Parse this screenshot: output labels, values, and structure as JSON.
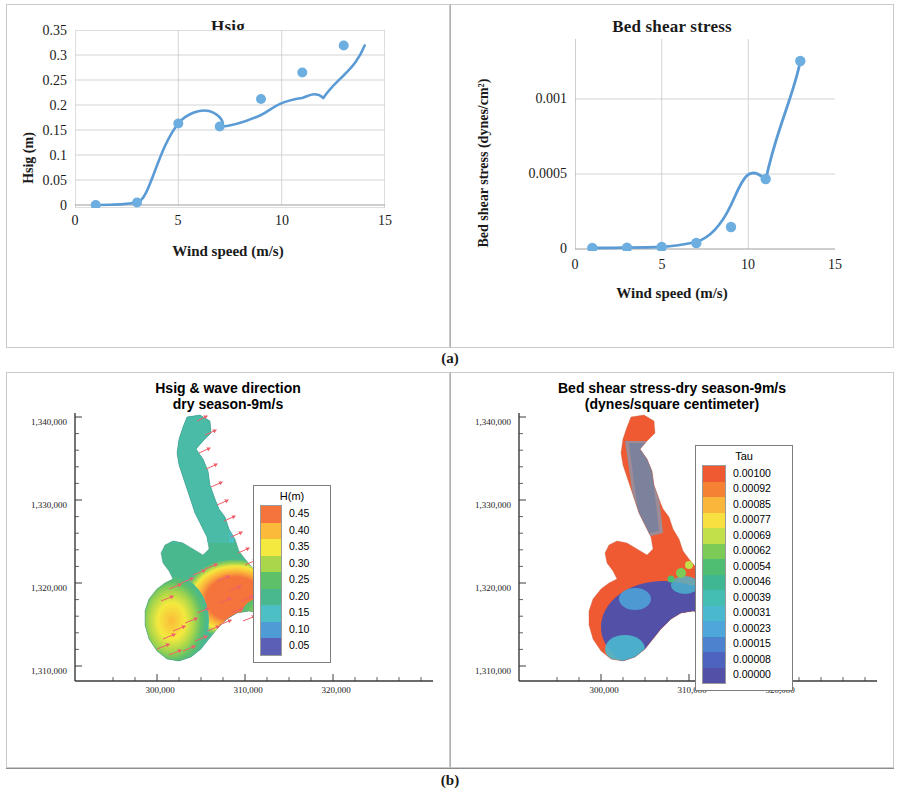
{
  "figure": {
    "caption_a": "(a)",
    "caption_b": "(b)"
  },
  "panel_a": {
    "left": {
      "title": "Hsig",
      "ylabel": "Hsig (m)",
      "xlabel": "Wind speed (m/s)",
      "yticks": [
        "0",
        "0.05",
        "0.1",
        "0.15",
        "0.2",
        "0.25",
        "0.3",
        "0.35"
      ],
      "xticks": [
        "0",
        "5",
        "10",
        "15"
      ]
    },
    "right": {
      "title": "Bed shear stress",
      "ylabel": "Bed shear stress (dynes/cm²)",
      "xlabel": "Wind speed (m/s)",
      "yticks": [
        "0",
        "0.0005",
        "0.001"
      ],
      "xticks": [
        "0",
        "5",
        "10",
        "15"
      ]
    }
  },
  "panel_b": {
    "left": {
      "title_line1": "Hsig & wave direction",
      "title_line2": "dry season-9m/s",
      "yticks": [
        "1,340,000",
        "1,330,000",
        "1,320,000",
        "1,310,000"
      ],
      "xticks": [
        "300,000",
        "310,000",
        "320,000"
      ],
      "legend": {
        "title": "H(m)",
        "labels": [
          "0.45",
          "0.40",
          "0.35",
          "0.30",
          "0.25",
          "0.20",
          "0.15",
          "0.10",
          "0.05"
        ],
        "colors": [
          "#F4743B",
          "#FBBA3A",
          "#F4E93E",
          "#A9D64A",
          "#5FC06A",
          "#49B88E",
          "#4BBFC4",
          "#4E9BD6",
          "#5B5FB5"
        ]
      }
    },
    "right": {
      "title_line1": "Bed shear stress-dry season-9m/s",
      "title_line2": "(dynes/square centimeter)",
      "yticks": [
        "1,340,000",
        "1,330,000",
        "1,320,000",
        "1,310,000"
      ],
      "xticks": [
        "300,000",
        "310,000",
        "320,000"
      ],
      "legend": {
        "title": "Tau",
        "labels": [
          "0.00100",
          "0.00092",
          "0.00085",
          "0.00077",
          "0.00069",
          "0.00062",
          "0.00054",
          "0.00046",
          "0.00039",
          "0.00031",
          "0.00023",
          "0.00015",
          "0.00008",
          "0.00000"
        ],
        "colors": [
          "#F05A32",
          "#F58233",
          "#F9B63A",
          "#F7E03F",
          "#C2E04A",
          "#7DCB57",
          "#4FBE73",
          "#3FB792",
          "#44BDB2",
          "#4AB9CF",
          "#4FA6DA",
          "#4C82CE",
          "#4E63BE",
          "#5350A8"
        ]
      }
    }
  },
  "chart_data": [
    {
      "type": "line",
      "title": "Hsig",
      "xlabel": "Wind speed (m/s)",
      "ylabel": "Hsig (m)",
      "x": [
        1,
        3,
        5,
        7,
        9,
        11,
        13
      ],
      "values": [
        0.0,
        0.005,
        0.163,
        0.159,
        0.212,
        0.265,
        0.32
      ],
      "xlim": [
        0,
        15
      ],
      "ylim": [
        0,
        0.35
      ],
      "xticks": [
        0,
        5,
        10,
        15
      ],
      "yticks": [
        0,
        0.05,
        0.1,
        0.15,
        0.2,
        0.25,
        0.3,
        0.35
      ],
      "grid": true,
      "legend": "none",
      "series_color": "#5B9BD5",
      "marker": "circle",
      "smooth": true
    },
    {
      "type": "line",
      "title": "Bed shear stress",
      "xlabel": "Wind speed (m/s)",
      "ylabel": "Bed shear stress (dynes/cm²)",
      "x": [
        1,
        3,
        5,
        7,
        9,
        11,
        13
      ],
      "values": [
        2e-06,
        3e-06,
        5e-06,
        2e-05,
        0.00015,
        0.00047,
        0.00126
      ],
      "xlim": [
        0,
        15
      ],
      "ylim": [
        0,
        0.0014
      ],
      "xticks": [
        0,
        5,
        10,
        15
      ],
      "yticks": [
        0,
        0.0005,
        0.001
      ],
      "grid": true,
      "legend": "none",
      "series_color": "#5B9BD5",
      "marker": "circle",
      "smooth": true
    },
    {
      "type": "heatmap",
      "title": "Hsig & wave direction dry season-9m/s",
      "variable": "H(m)",
      "levels": [
        0.05,
        0.1,
        0.15,
        0.2,
        0.25,
        0.3,
        0.35,
        0.4,
        0.45
      ],
      "colors": [
        "#5B5FB5",
        "#4E9BD6",
        "#4BBFC4",
        "#49B88E",
        "#5FC06A",
        "#A9D64A",
        "#F4E93E",
        "#FBBA3A",
        "#F4743B"
      ],
      "xlim": [
        294000,
        327000
      ],
      "ylim": [
        1306000,
        1341000
      ],
      "xticks": [
        300000,
        310000,
        320000
      ],
      "yticks": [
        1310000,
        1320000,
        1330000,
        1340000
      ],
      "overlay": "wave direction arrows"
    },
    {
      "type": "heatmap",
      "title": "Bed shear stress-dry season-9m/s (dynes/square centimeter)",
      "variable": "Tau",
      "levels": [
        0.0,
        8e-05,
        0.00015,
        0.00023,
        0.00031,
        0.00039,
        0.00046,
        0.00054,
        0.00062,
        0.00069,
        0.00077,
        0.00085,
        0.00092,
        0.001
      ],
      "colors": [
        "#5350A8",
        "#4E63BE",
        "#4C82CE",
        "#4FA6DA",
        "#4AB9CF",
        "#44BDB2",
        "#3FB792",
        "#4FBE73",
        "#7DCB57",
        "#C2E04A",
        "#F7E03F",
        "#F9B63A",
        "#F58233",
        "#F05A32"
      ],
      "xlim": [
        294000,
        327000
      ],
      "ylim": [
        1306000,
        1341000
      ],
      "xticks": [
        300000,
        310000,
        320000
      ],
      "yticks": [
        1310000,
        1320000,
        1330000,
        1340000
      ]
    }
  ]
}
